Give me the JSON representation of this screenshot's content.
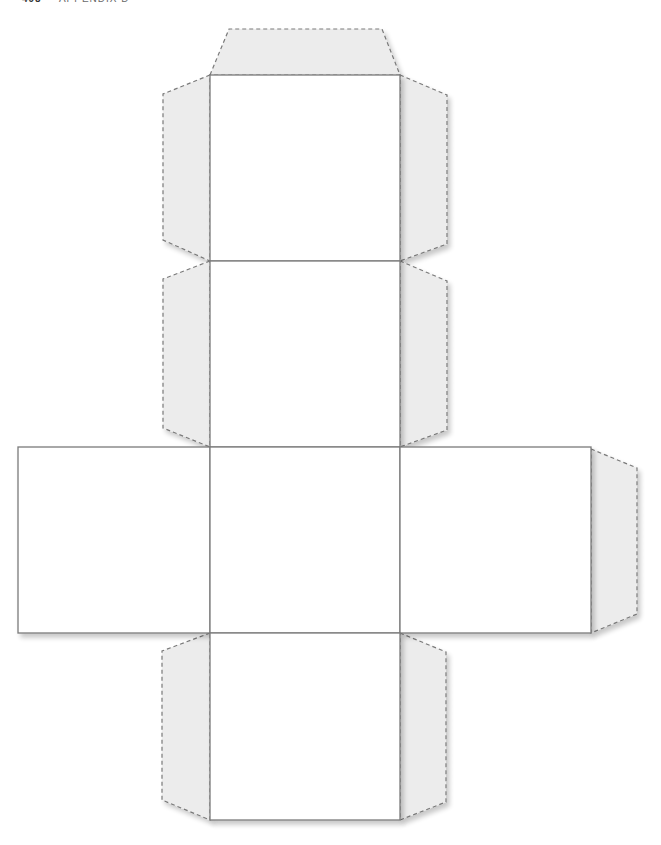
{
  "page": {
    "header": {
      "page_number": "498",
      "section": "APPENDIX D"
    }
  },
  "figure": {
    "type": "cube-net",
    "colors": {
      "face_stroke": "#7a7a7a",
      "tab_fill": "#ececec",
      "tab_stroke": "#7a7a7a",
      "shadow": "#d8d8d8"
    },
    "faces": [
      {
        "id": "top",
        "x": 210,
        "y": 75,
        "w": 190,
        "h": 186
      },
      {
        "id": "upper-middle",
        "x": 210,
        "y": 261,
        "w": 190,
        "h": 186
      },
      {
        "id": "left",
        "x": 18,
        "y": 447,
        "w": 192,
        "h": 186
      },
      {
        "id": "center",
        "x": 210,
        "y": 447,
        "w": 190,
        "h": 186
      },
      {
        "id": "right",
        "x": 400,
        "y": 447,
        "w": 191,
        "h": 186
      },
      {
        "id": "bottom",
        "x": 210,
        "y": 633,
        "w": 190,
        "h": 187
      }
    ]
  }
}
